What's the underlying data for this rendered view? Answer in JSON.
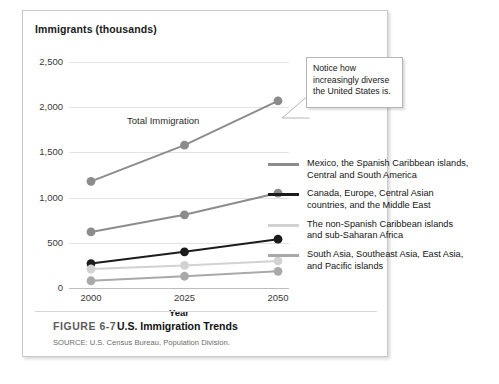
{
  "figure": {
    "number": "FIGURE 6-7",
    "title": "U.S. Immigration Trends",
    "source": "SOURCE: U.S. Census Bureau, Population Division."
  },
  "callout": {
    "text": "Notice how increasingly diverse the United States is."
  },
  "colors": {
    "total": "#8c8c8c",
    "mexico": "#8c8c8c",
    "canada": "#1c1c1c",
    "caribbean": "#d2d2d2",
    "asia": "#a9a9a9",
    "gridline": "#e3e3e3",
    "axis": "#bdbdbd",
    "frame_border": "#c9c9c9"
  },
  "chart_data": {
    "type": "line",
    "title": "Immigrants  (thousands)",
    "xlabel": "Year",
    "ylabel": "Immigrants (thousands)",
    "x": [
      2000,
      2025,
      2050
    ],
    "xticklabels": [
      "2000",
      "2025",
      "2050"
    ],
    "yticklabels": [
      "0",
      "500",
      "1,000",
      "1,500",
      "2,000",
      "2,500"
    ],
    "ylim": [
      0,
      2500
    ],
    "ytick_step": 500,
    "grid": true,
    "legend_position": "right",
    "annotations": [
      {
        "text": "Total Immigration",
        "series": "Total Immigration"
      },
      {
        "text": "Notice how increasingly diverse the United States is.",
        "target": "Total Immigration at 2050"
      }
    ],
    "series": [
      {
        "name": "Total Immigration",
        "legend": null,
        "color": "#8c8c8c",
        "values": [
          1180,
          1580,
          2070
        ]
      },
      {
        "name": "Mexico, the Spanish Caribbean islands, Central and South America",
        "legend": "Mexico, the Spanish Caribbean islands, Central and South America",
        "color": "#8c8c8c",
        "values": [
          620,
          810,
          1050
        ]
      },
      {
        "name": "Canada, Europe, Central Asian countries, and the Middle East",
        "legend": "Canada, Europe, Central Asian countries, and the Middle East",
        "color": "#1c1c1c",
        "values": [
          270,
          400,
          540
        ]
      },
      {
        "name": "The non-Spanish Caribbean islands and sub-Saharan Africa",
        "legend": "The non-Spanish Caribbean islands and sub-Saharan Africa",
        "color": "#d2d2d2",
        "values": [
          210,
          250,
          300
        ]
      },
      {
        "name": "South Asia, Southeast Asia, East Asia, and Pacific islands",
        "legend": "South Asia, Southeast Asia, East Asia, and Pacific islands",
        "color": "#a9a9a9",
        "values": [
          80,
          130,
          185
        ]
      }
    ]
  },
  "legend": [
    {
      "color": "#8c8c8c",
      "line1": "Mexico, the Spanish Caribbean islands,",
      "line2": "Central and South America"
    },
    {
      "color": "#1c1c1c",
      "line1": "Canada, Europe, Central Asian",
      "line2": "countries, and the Middle East"
    },
    {
      "color": "#d2d2d2",
      "line1": "The non-Spanish Caribbean islands",
      "line2": "and sub-Saharan Africa"
    },
    {
      "color": "#a9a9a9",
      "line1": "South Asia, Southeast Asia, East Asia,",
      "line2": "and Pacific islands"
    }
  ]
}
